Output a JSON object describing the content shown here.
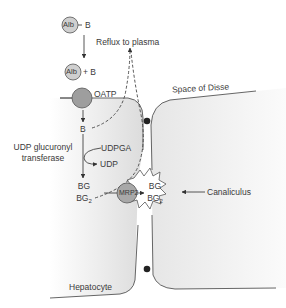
{
  "diagram": {
    "type": "bilirubin-transport-pathway",
    "nodes": {
      "alb_bound": {
        "circle": "Alb",
        "suffix": "B"
      },
      "alb_free": {
        "circle": "Alb",
        "suffix": "+ B"
      },
      "oatp": "OATP",
      "bilirubin": "B",
      "udpga": "UDPGA",
      "udp": "UDP",
      "enzyme": {
        "line1": "UDP glucuronyl",
        "line2": "transferase"
      },
      "bg_left": {
        "line1": "BG",
        "line2": "BG",
        "sub": "2"
      },
      "mrp2": "MRP2",
      "bg_right": {
        "line1": "BG",
        "line2": "BG",
        "sub": "2"
      }
    },
    "labels": {
      "reflux": "Reflux to plasma",
      "space_of_disse": "Space of Disse",
      "canaliculus": "Canaliculus",
      "hepatocyte": "Hepatocyte"
    },
    "colors": {
      "cell_fill": "#e8e8e8",
      "circle_fill": "#b3b3b3",
      "alb_fill": "#cfcfcf",
      "stroke": "#555555",
      "junction": "#222222"
    }
  }
}
